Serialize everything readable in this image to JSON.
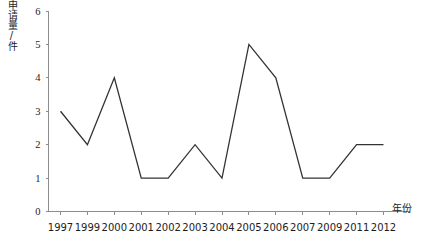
{
  "chart_data": {
    "type": "line",
    "title": "",
    "subtitle": "",
    "xlabel": "年份",
    "ylabel": "申请量/件",
    "categories": [
      "1997",
      "1999",
      "2000",
      "2001",
      "2002",
      "2003",
      "2004",
      "2005",
      "2006",
      "2007",
      "2009",
      "2011",
      "2012"
    ],
    "values": [
      3,
      2,
      4,
      1,
      1,
      2,
      1,
      5,
      4,
      1,
      1,
      2,
      2
    ],
    "series": [
      {
        "name": "申请量",
        "values": [
          3,
          2,
          4,
          1,
          1,
          2,
          1,
          5,
          4,
          1,
          1,
          2,
          2
        ]
      }
    ],
    "ylim": [
      0,
      6
    ],
    "yticks": [
      0,
      1,
      2,
      3,
      4,
      5,
      6
    ],
    "ytick_labels": [
      "0",
      "1",
      "2",
      "3",
      "4",
      "5",
      "6"
    ],
    "xtick_labels": [
      "1997",
      "1999",
      "2000",
      "2001",
      "2002",
      "2003",
      "2004",
      "2005",
      "2006",
      "2007",
      "2009",
      "2011",
      "2012"
    ],
    "grid": false,
    "legend": false,
    "legend_position": "none",
    "line_color": "#333333",
    "axis_color": "#8d8d8d",
    "background_color": "#ffffff",
    "annotations": []
  },
  "axis": {
    "y_title": "申请量/件",
    "x_title": "年份"
  }
}
